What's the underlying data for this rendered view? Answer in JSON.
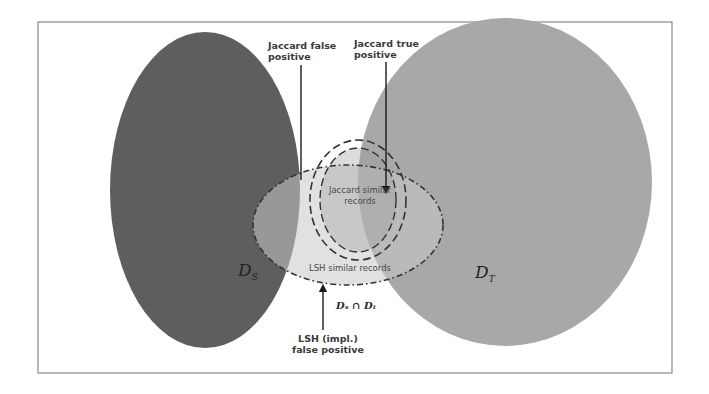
{
  "figure": {
    "type": "venn-diagram",
    "sets": {
      "source": {
        "label_main": "D",
        "label_sub": "S",
        "color": "#5e5e5e"
      },
      "target": {
        "label_main": "D",
        "label_sub": "T",
        "color": "#a8a8a8"
      }
    },
    "intersection_label": "Dₛ ∩ Dₜ",
    "regions": {
      "jaccard_similar": {
        "line1": "Jaccard similar",
        "line2": "records",
        "style": "dashed"
      },
      "lsh_similar": {
        "label": "LSH similar records",
        "style": "dash-dot"
      }
    },
    "annotations": {
      "jaccard_false_positive": {
        "line1": "Jaccard false",
        "line2": "positive"
      },
      "jaccard_true_positive": {
        "line1": "Jaccard true",
        "line2": "positive"
      },
      "lsh_false_positive": {
        "line1": "LSH (impl.)",
        "line2": "false positive"
      }
    },
    "colors": {
      "frame": "#8a8a8a",
      "ds_fill": "#5e5e5e",
      "dt_fill": "#a8a8a8",
      "overlap_fill": "#7c7c7c",
      "lsh_fill": "#b4b4b4",
      "arrow": "#1a1a1a"
    }
  }
}
